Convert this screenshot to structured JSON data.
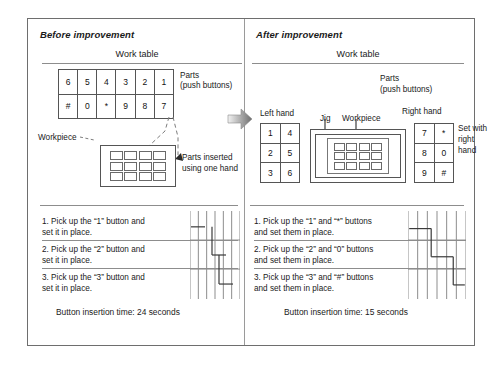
{
  "figure": {
    "panels": [
      {
        "id": "before",
        "heading": "Before improvement",
        "work_table_label": "Work table",
        "parts_label_line1": "Parts",
        "parts_label_line2": "(push buttons)",
        "workpiece_label": "Workpiece",
        "inserted_label_line1": "Parts inserted",
        "inserted_label_line2": "using one hand",
        "parts_table": {
          "rows": [
            [
              "6",
              "5",
              "4",
              "3",
              "2",
              "1"
            ],
            [
              "#",
              "0",
              "*",
              "9",
              "8",
              "7"
            ]
          ]
        },
        "workpiece_grid": {
          "columns": 4,
          "rows": 3
        },
        "steps": [
          "1. Pick up the “1” button and\n     set it in place.",
          "2. Pick up the “2” button and\n     set it in place.",
          "3. Pick up the “3” button and\n     set it in place."
        ],
        "insertion_time": "Button insertion time: 24 seconds",
        "timing": {
          "gridlines": 6,
          "bars": [
            {
              "start": 0.02,
              "end": 0.3,
              "y": 0.18
            },
            {
              "start": 0.44,
              "end": 0.72,
              "y": 0.5
            },
            {
              "start": 0.58,
              "end": 0.86,
              "y": 0.83
            }
          ]
        }
      },
      {
        "id": "after",
        "heading": "After improvement",
        "work_table_label": "Work table",
        "parts_label_line1": "Parts",
        "parts_label_line2": "(push buttons)",
        "left_hand_label": "Left hand",
        "right_hand_label": "Right hand",
        "jig_label": "Jig",
        "workpiece_label": "Workpiece",
        "set_with_right_hand": "Set\nwith\nright\nhand",
        "left_hand_table": {
          "rows": [
            [
              "1",
              "4"
            ],
            [
              "2",
              "5"
            ],
            [
              "3",
              "6"
            ]
          ]
        },
        "right_hand_table": {
          "rows": [
            [
              "7",
              "*"
            ],
            [
              "8",
              "0"
            ],
            [
              "9",
              "#"
            ]
          ]
        },
        "workpiece_grid": {
          "columns": 4,
          "rows": 3
        },
        "steps": [
          "1. Pick up the “1” and “*” buttons\n     and set them in place.",
          "2. Pick up the “2” and “0” buttons\n     and set them in place.",
          "3. Pick up the “3” and “#” buttons\n     and set them in place."
        ],
        "insertion_time": "Button insertion time: 15 seconds",
        "timing": {
          "gridlines": 6,
          "bars": [
            {
              "start": 0.02,
              "end": 0.4,
              "y": 0.2
            },
            {
              "start": 0.4,
              "end": 0.78,
              "y": 0.52
            },
            {
              "start": 0.78,
              "end": 0.98,
              "y": 0.84
            }
          ]
        }
      }
    ],
    "transition_arrow": "right-arrow",
    "colors": {
      "frame": "#6e6e6e",
      "rule": "#8d8d8d",
      "cell_border": "#555555",
      "text": "#1a1a1a",
      "arrow": "#9a9a9a"
    }
  }
}
